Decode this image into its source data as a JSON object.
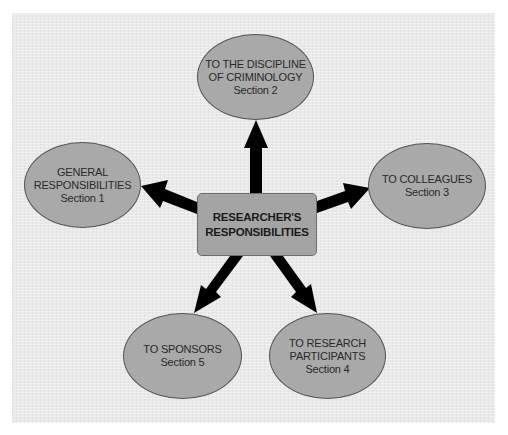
{
  "center": {
    "line1": "RESEARCHER'S",
    "line2": "RESPONSIBILITIES"
  },
  "nodes": {
    "top": {
      "line1": "TO THE DISCIPLINE",
      "line2": "OF CRIMINOLOGY",
      "section": "Section 2"
    },
    "left": {
      "line1": "GENERAL",
      "line2": "RESPONSIBILITIES",
      "section": "Section 1"
    },
    "right": {
      "line1": "TO COLLEAGUES",
      "section": "Section 3"
    },
    "bottom_right": {
      "line1": "TO RESEARCH",
      "line2": "PARTICIPANTS",
      "section": "Section 4"
    },
    "bottom_left": {
      "line1": "TO SPONSORS",
      "section": "Section 5"
    }
  },
  "colors": {
    "panel": "#e9e9e9",
    "node_fill": "#a9a9a9",
    "box_fill": "#a4a4a4",
    "arrow": "#000000"
  }
}
